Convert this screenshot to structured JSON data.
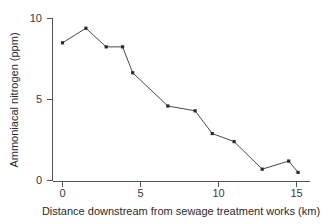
{
  "chart_data": {
    "type": "line",
    "title": "",
    "xlabel": "Distance downstream from sewage treatment works (km)",
    "ylabel": "Ammoniacal nitrogen (ppm)",
    "xlim": [
      -0.6,
      16.0
    ],
    "ylim": [
      0,
      10.3
    ],
    "xticks": [
      0,
      5,
      10,
      15
    ],
    "xtick_labels": [
      "0",
      "5",
      "10",
      "15"
    ],
    "yticks": [
      0,
      5,
      10
    ],
    "ytick_labels": [
      "0",
      "5",
      "10"
    ],
    "grid": false,
    "legend": "none",
    "marker": "square",
    "series": [
      {
        "name": "Ammoniacal nitrogen",
        "x": [
          0.0,
          1.5,
          2.8,
          3.85,
          4.5,
          6.75,
          8.5,
          9.6,
          11.0,
          12.8,
          14.5,
          15.1
        ],
        "y": [
          8.5,
          9.4,
          8.25,
          8.25,
          6.65,
          4.6,
          4.3,
          2.9,
          2.4,
          0.7,
          1.2,
          0.5
        ]
      }
    ]
  },
  "axis": {
    "x_title": "Distance downstream from sewage treatment works (km)",
    "y_title": "Ammoniacal nitrogen (ppm)",
    "x_tick_0": "0",
    "x_tick_1": "5",
    "x_tick_2": "10",
    "x_tick_3": "15",
    "y_tick_0": "0",
    "y_tick_1": "5",
    "y_tick_2": "10"
  },
  "colors": {
    "line": "#4a4a4a",
    "marker": "#2a2a2a",
    "axis": "#555555",
    "text": "#2b2b2b",
    "background": "#ffffff"
  }
}
